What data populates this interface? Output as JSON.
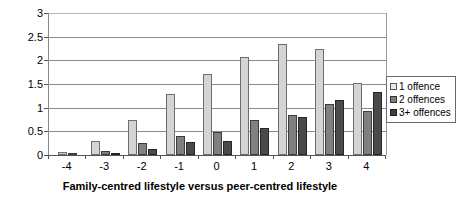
{
  "chart_data": {
    "type": "bar",
    "title": "",
    "xlabel": "Family-centred lifestyle versus peer-centred lifestyle",
    "ylabel": "",
    "categories": [
      "-4",
      "-3",
      "-2",
      "-1",
      "0",
      "1",
      "2",
      "3",
      "4"
    ],
    "ylim": [
      0,
      3
    ],
    "yticks": [
      "0",
      "0.5",
      "1",
      "1.5",
      "2",
      "2.5",
      "3"
    ],
    "ytick_values": [
      0,
      0.5,
      1,
      1.5,
      2,
      2.5,
      3
    ],
    "grid": true,
    "legend_position": "right",
    "series": [
      {
        "name": "1 offence",
        "color": "#d4d4d4",
        "values": [
          0.06,
          0.3,
          0.73,
          1.28,
          1.72,
          2.07,
          2.35,
          2.23,
          1.53
        ]
      },
      {
        "name": "2 offences",
        "color": "#808080",
        "values": [
          0.02,
          0.08,
          0.25,
          0.4,
          0.48,
          0.73,
          0.85,
          1.08,
          0.93
        ]
      },
      {
        "name": "3+ offences",
        "color": "#4a4a4a",
        "values": [
          0.0,
          0.02,
          0.12,
          0.27,
          0.3,
          0.57,
          0.8,
          1.17,
          1.33
        ]
      }
    ]
  }
}
